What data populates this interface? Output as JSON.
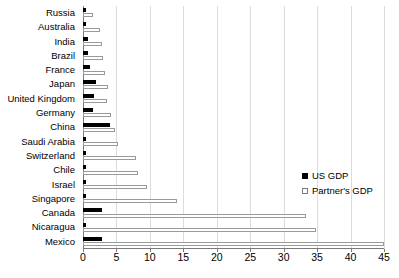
{
  "chart_data": {
    "type": "bar",
    "orientation": "horizontal",
    "title": "",
    "xlabel": "",
    "ylabel": "",
    "xlim": [
      0,
      45
    ],
    "xticks": [
      0,
      5,
      10,
      15,
      20,
      25,
      30,
      35,
      40,
      45
    ],
    "grid": true,
    "legend_position": "right-middle",
    "categories": [
      "Russia",
      "Australia",
      "India",
      "Brazil",
      "France",
      "Japan",
      "United Kingdom",
      "Germany",
      "China",
      "Saudi Arabia",
      "Switzerland",
      "Chile",
      "Israel",
      "Singapore",
      "Canada",
      "Nicaragua",
      "Mexico"
    ],
    "series": [
      {
        "name": "US GDP",
        "color": "#000000",
        "values": [
          0.2,
          0.3,
          0.8,
          0.7,
          1.1,
          2.0,
          1.6,
          1.5,
          4.0,
          0.3,
          0.4,
          0.3,
          0.3,
          0.3,
          2.9,
          0.2,
          2.8
        ]
      },
      {
        "name": "Partner's GDP",
        "color": "#ffffff",
        "values": [
          1.5,
          2.5,
          2.8,
          3.0,
          3.3,
          3.7,
          3.6,
          4.2,
          4.8,
          5.2,
          7.9,
          8.2,
          9.6,
          14.0,
          33.3,
          34.8,
          45.0
        ]
      }
    ]
  },
  "legend": {
    "items": [
      {
        "label": "US GDP",
        "marker": "filled-square"
      },
      {
        "label": "Partner's GDP",
        "marker": "open-square"
      }
    ]
  }
}
